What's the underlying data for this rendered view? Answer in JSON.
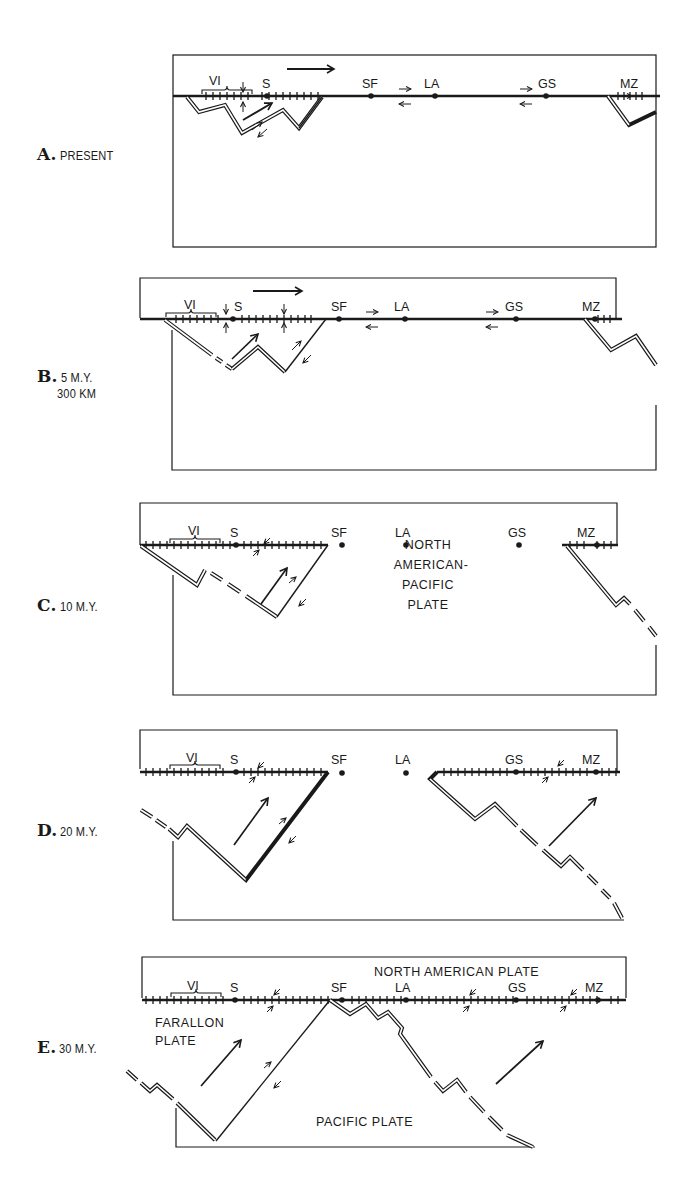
{
  "figure": {
    "panels": [
      {
        "id": "A",
        "letter": "A.",
        "caption": "PRESENT",
        "caption_line2": ""
      },
      {
        "id": "B",
        "letter": "B.",
        "caption": "5 M.Y.",
        "caption_line2": "300 KM"
      },
      {
        "id": "C",
        "letter": "C.",
        "caption": "10 M.Y.",
        "caption_line2": ""
      },
      {
        "id": "D",
        "letter": "D.",
        "caption": "20 M.Y.",
        "caption_line2": ""
      },
      {
        "id": "E",
        "letter": "E.",
        "caption": "30 M.Y.",
        "caption_line2": ""
      }
    ],
    "locations": {
      "vi": "VI",
      "s": "S",
      "sf": "SF",
      "la": "LA",
      "gs": "GS",
      "mz": "MZ"
    },
    "plate_labels": {
      "na_pacific_line1": "NORTH",
      "na_pacific_line2": "AMERICAN-",
      "na_pacific_line3": "PACIFIC",
      "na_pacific_line4": "PLATE",
      "north_american": "NORTH AMERICAN PLATE",
      "farallon_line1": "FARALLON",
      "farallon_line2": "PLATE",
      "pacific": "PACIFIC PLATE"
    },
    "colors": {
      "ink": "#1a1a1a",
      "paper": "#ffffff"
    }
  }
}
